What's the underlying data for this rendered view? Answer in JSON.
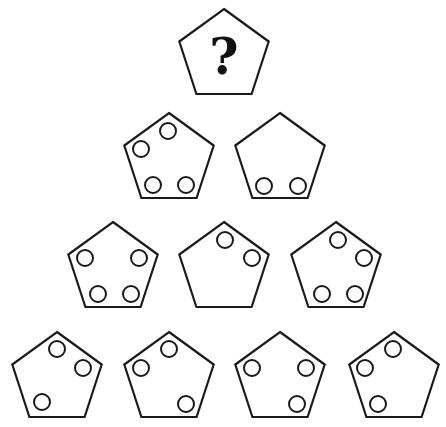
{
  "puzzle": {
    "type": "pentagon-pyramid-pattern",
    "question_mark": "?",
    "colors": {
      "stroke": "#1a1a1a",
      "fill": "#ffffff",
      "text": "#111111"
    },
    "circle_radius": 8,
    "pentagon_radius": 47,
    "rows": [
      {
        "row": 1,
        "cells": [
          {
            "id": "r1c1",
            "cx": 224,
            "cy": 56,
            "question": true,
            "circles": []
          }
        ]
      },
      {
        "row": 2,
        "cells": [
          {
            "id": "r2c1",
            "cx": 169,
            "cy": 160,
            "circles": [
              [
                168,
                131
              ],
              [
                141,
                149
              ],
              [
                153,
                185
              ],
              [
                186,
                185
              ]
            ]
          },
          {
            "id": "r2c2",
            "cx": 280,
            "cy": 160,
            "circles": [
              [
                264,
                186
              ],
              [
                298,
                186
              ]
            ]
          }
        ]
      },
      {
        "row": 3,
        "cells": [
          {
            "id": "r3c1",
            "cx": 113,
            "cy": 269,
            "circles": [
              [
                85,
                258
              ],
              [
                139,
                258
              ],
              [
                98,
                294
              ],
              [
                131,
                294
              ]
            ]
          },
          {
            "id": "r3c2",
            "cx": 224,
            "cy": 269,
            "circles": [
              [
                225,
                240
              ],
              [
                252,
                258
              ]
            ]
          },
          {
            "id": "r3c3",
            "cx": 336,
            "cy": 269,
            "circles": [
              [
                338,
                240
              ],
              [
                364,
                258
              ],
              [
                322,
                294
              ],
              [
                355,
                294
              ]
            ]
          }
        ]
      },
      {
        "row": 4,
        "cells": [
          {
            "id": "r4c1",
            "cx": 57,
            "cy": 379,
            "circles": [
              [
                57,
                349
              ],
              [
                83,
                368
              ],
              [
                42,
                402
              ]
            ]
          },
          {
            "id": "r4c2",
            "cx": 169,
            "cy": 379,
            "circles": [
              [
                169,
                349
              ],
              [
                141,
                368
              ],
              [
                186,
                404
              ]
            ]
          },
          {
            "id": "r4c3",
            "cx": 280,
            "cy": 379,
            "circles": [
              [
                252,
                368
              ],
              [
                306,
                368
              ],
              [
                297,
                404
              ]
            ]
          },
          {
            "id": "r4c4",
            "cx": 394,
            "cy": 379,
            "circles": [
              [
                393,
                349
              ],
              [
                365,
                368
              ],
              [
                378,
                404
              ]
            ]
          }
        ]
      }
    ]
  }
}
